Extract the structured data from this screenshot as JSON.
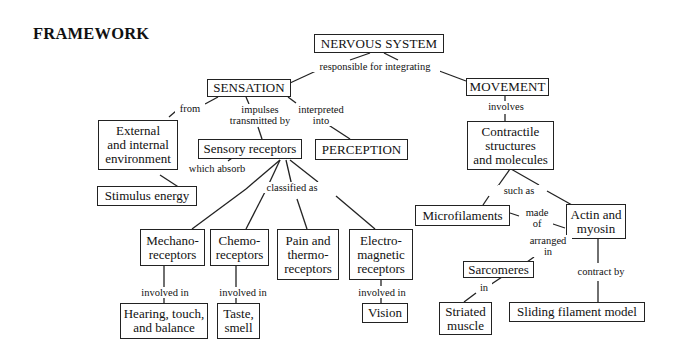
{
  "title": "FRAMEWORK",
  "nodes": {
    "nervous_system": "NERVOUS SYSTEM",
    "sensation": "SENSATION",
    "movement": "MOVEMENT",
    "environment": "External\nand internal\nenvironment",
    "sensory_receptors": "Sensory receptors",
    "perception": "PERCEPTION",
    "stimulus_energy": "Stimulus energy",
    "mechanoreceptors": "Mechano-\nreceptors",
    "chemoreceptors": "Chemo-\nreceptors",
    "pain_thermoreceptors": "Pain and\nthermo-\nreceptors",
    "electromagnetic_receptors": "Electro-\nmagnetic\nreceptors",
    "hearing_touch_balance": "Hearing, touch,\nand balance",
    "taste_smell": "Taste,\nsmell",
    "vision": "Vision",
    "contractile_structures": "Contractile\nstructures\nand molecules",
    "microfilaments": "Microfilaments",
    "actin_myosin": "Actin and\nmyosin",
    "sarcomeres": "Sarcomeres",
    "striated_muscle": "Striated\nmuscle",
    "sliding_filament_model": "Sliding filament model"
  },
  "links": {
    "responsible_for_integrating": "responsible for integrating",
    "from": "from",
    "impulses_transmitted_by": "impulses\ntransmitted by",
    "interpreted_into": "interpreted\ninto",
    "involves": "involves",
    "which_absorb": "which absorb",
    "classified_as": "classified as",
    "involved_in_mechano": "involved in",
    "involved_in_chemo": "involved in",
    "involved_in_electro": "involved in",
    "such_as": "such as",
    "made_of": "made\nof",
    "arranged_in": "arranged\nin",
    "in": "in",
    "contract_by": "contract by"
  },
  "colors": {
    "line": "#222222",
    "text": "#111111",
    "background": "#ffffff"
  }
}
